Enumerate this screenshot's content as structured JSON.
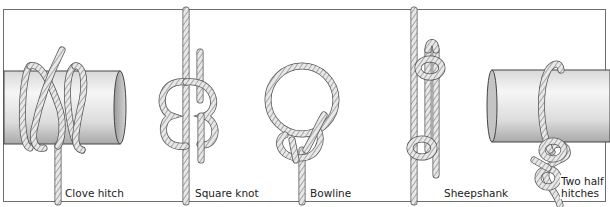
{
  "figure": {
    "knots": [
      {
        "id": "clove-hitch",
        "label": "Clove hitch",
        "tied_to": "post"
      },
      {
        "id": "square-knot",
        "label": "Square knot",
        "tied_to": "rope"
      },
      {
        "id": "bowline",
        "label": "Bowline",
        "tied_to": "loop"
      },
      {
        "id": "sheepshank",
        "label": "Sheepshank",
        "tied_to": "rope"
      },
      {
        "id": "two-half-hitches",
        "label_line1": "Two half",
        "label_line2": "hitches",
        "tied_to": "post"
      }
    ]
  },
  "colors": {
    "frame": "#6e6e6e",
    "rope_fill": "#e6e6e6",
    "rope_stroke": "#555555",
    "rope_hatch": "#8a8a8a",
    "post_light": "#f2f2f2",
    "post_shade": "#bdbdbd",
    "text": "#222222"
  }
}
